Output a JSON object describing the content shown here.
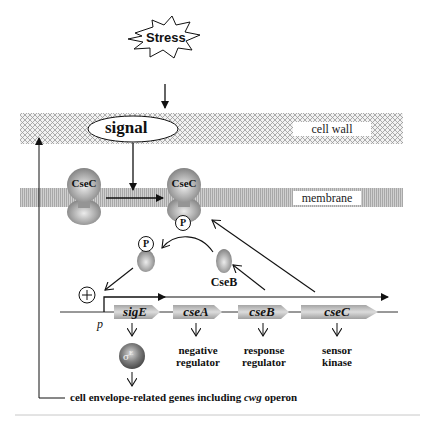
{
  "diagram": {
    "colors": {
      "line": "#111111",
      "band_pattern": "#9a9a9a",
      "protein": "#8c8c8c",
      "protein_highlight": "#e8e8e8",
      "gene_box": "#9e9e9e",
      "gene_box_highlight": "#dedede",
      "separator": "#c8c8c8"
    },
    "stress": {
      "label": "Stress"
    },
    "signal": {
      "label": "signal"
    },
    "layers": {
      "cell_wall": {
        "label": "cell wall"
      },
      "membrane": {
        "label": "membrane"
      }
    },
    "proteins": {
      "csec_inactive": {
        "label": "CseC"
      },
      "csec_active": {
        "label": "CseC",
        "phospho": "P"
      },
      "cseb_free": {
        "label": "CseB"
      },
      "cseb_phospho": {
        "phospho": "P"
      },
      "sigma_e": {
        "label": "σ",
        "superscript": "E"
      }
    },
    "promoter": {
      "label": "p",
      "activation_symbol": "+"
    },
    "genes": [
      {
        "name": "sigE",
        "description": ""
      },
      {
        "name": "cseA",
        "description": "negative\nregulator"
      },
      {
        "name": "cseB",
        "description": "response\nregulator"
      },
      {
        "name": "cseC",
        "description": "sensor\nkinase"
      }
    ],
    "gene_descriptions": {
      "cseA": [
        "negative",
        "regulator"
      ],
      "cseB": [
        "response",
        "regulator"
      ],
      "cseC": [
        "sensor",
        "kinase"
      ]
    },
    "output": {
      "prefix": "cell envelope-related genes including ",
      "italic": "cwg",
      "suffix": " operon"
    }
  }
}
